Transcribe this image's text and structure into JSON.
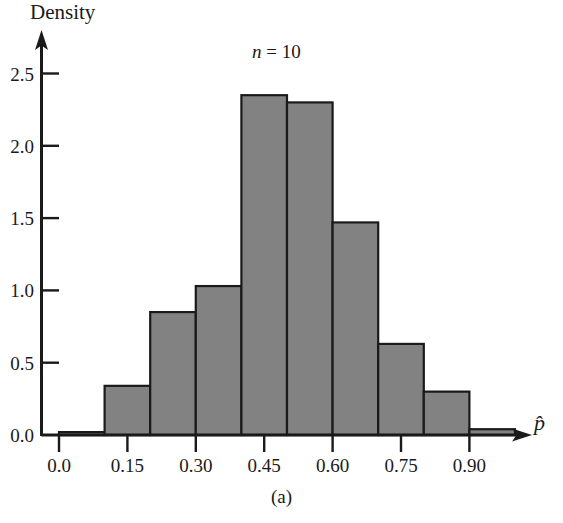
{
  "figure": {
    "caption": "(a)",
    "annotation_prefix": "n",
    "annotation_eq": " = ",
    "annotation_value": "10",
    "annotation_full": "n = 10"
  },
  "axes": {
    "y_title": "Density",
    "x_title": "p̂",
    "y_ticks": [
      "0.0",
      "0.5",
      "1.0",
      "1.5",
      "2.0",
      "2.5"
    ],
    "x_ticks": [
      "0.0",
      "0.15",
      "0.30",
      "0.45",
      "0.60",
      "0.75",
      "0.90"
    ]
  },
  "style": {
    "bar_fill": "#828282",
    "bar_stroke": "#1a1a1a",
    "axis_color": "#1a1a1a",
    "background": "#ffffff"
  },
  "chart_data": {
    "type": "bar",
    "title": "",
    "subtitle": "n = 10",
    "xlabel": "p̂",
    "ylabel": "Density",
    "grid": false,
    "legend": "none",
    "bin_width": 0.1,
    "bin_edges": [
      0.0,
      0.1,
      0.2,
      0.3,
      0.4,
      0.5,
      0.6,
      0.7,
      0.8,
      0.9,
      1.0
    ],
    "categories": [
      "0.0-0.1",
      "0.1-0.2",
      "0.2-0.3",
      "0.3-0.4",
      "0.4-0.5",
      "0.5-0.6",
      "0.6-0.7",
      "0.7-0.8",
      "0.8-0.9",
      "0.9-1.0"
    ],
    "values": [
      0.02,
      0.34,
      0.85,
      1.03,
      2.35,
      2.3,
      1.47,
      0.63,
      0.3,
      0.04
    ],
    "xlim": [
      0.0,
      1.0
    ],
    "ylim": [
      0.0,
      2.5
    ],
    "y_ticks": [
      0.0,
      0.5,
      1.0,
      1.5,
      2.0,
      2.5
    ],
    "x_ticks": [
      0.0,
      0.15,
      0.3,
      0.45,
      0.6,
      0.75,
      0.9
    ]
  }
}
